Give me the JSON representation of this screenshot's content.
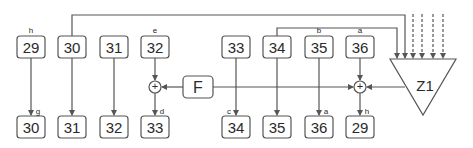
{
  "diagram": {
    "colors": {
      "stroke": "#555555",
      "text": "#2a2a2a",
      "background": "#ffffff"
    },
    "top_row": [
      {
        "id": "t29",
        "value": "29",
        "label": "h",
        "x": 26
      },
      {
        "id": "t30",
        "value": "30",
        "label": "",
        "x": 67
      },
      {
        "id": "t31",
        "value": "31",
        "label": "",
        "x": 108
      },
      {
        "id": "t32",
        "value": "32",
        "label": "e",
        "x": 150
      },
      {
        "id": "t33",
        "value": "33",
        "label": "",
        "x": 231
      },
      {
        "id": "t34",
        "value": "34",
        "label": "",
        "x": 272
      },
      {
        "id": "t35",
        "value": "35",
        "label": "b",
        "x": 313
      },
      {
        "id": "t36",
        "value": "36",
        "label": "a",
        "x": 354
      }
    ],
    "bottom_row": [
      {
        "id": "b30",
        "value": "30",
        "label": "g",
        "x": 26
      },
      {
        "id": "b31",
        "value": "31",
        "label": "",
        "x": 67
      },
      {
        "id": "b32",
        "value": "32",
        "label": "",
        "x": 108
      },
      {
        "id": "b33",
        "value": "33",
        "label": "d",
        "x": 150
      },
      {
        "id": "b34",
        "value": "34",
        "label": "c",
        "x": 231
      },
      {
        "id": "b35",
        "value": "35",
        "label": "",
        "x": 272
      },
      {
        "id": "b36",
        "value": "36",
        "label": "a",
        "x": 313
      },
      {
        "id": "b29",
        "value": "29",
        "label": "h",
        "x": 354
      }
    ],
    "function_block": {
      "label": "F"
    },
    "adders": [
      {
        "symbol": "+"
      },
      {
        "symbol": "+"
      }
    ],
    "triangle_block": {
      "label": "Z1"
    },
    "dashed_inputs": 4
  }
}
